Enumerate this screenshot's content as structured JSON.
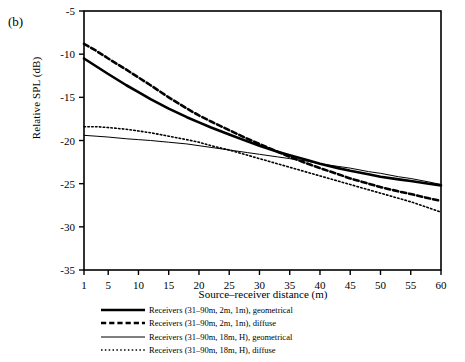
{
  "panel": {
    "label": "(b)"
  },
  "chart_data": {
    "type": "line",
    "title": "",
    "xlabel": "Source–receiver distance (m)",
    "ylabel": "Relative SPL (dB)",
    "xlim": [
      1,
      60
    ],
    "ylim": [
      -35,
      -5
    ],
    "grid": false,
    "legend_position": "below",
    "xticks": [
      1,
      5,
      10,
      15,
      20,
      25,
      30,
      35,
      40,
      45,
      50,
      55,
      60
    ],
    "yticks": [
      -5,
      -10,
      -15,
      -20,
      -25,
      -30,
      -35
    ],
    "x": [
      1,
      3,
      5,
      8,
      10,
      12,
      15,
      18,
      20,
      22,
      25,
      28,
      30,
      33,
      35,
      38,
      40,
      43,
      45,
      48,
      50,
      53,
      55,
      58,
      60
    ],
    "series": [
      {
        "name": "Receivers (31–90m, 2m, 1m), geometrical",
        "style": "solid",
        "width": 2.6,
        "color": "#000000",
        "values": [
          -10.5,
          -11.4,
          -12.3,
          -13.6,
          -14.4,
          -15.2,
          -16.3,
          -17.3,
          -17.9,
          -18.5,
          -19.3,
          -20.1,
          -20.6,
          -21.3,
          -21.7,
          -22.3,
          -22.7,
          -23.2,
          -23.5,
          -23.9,
          -24.2,
          -24.5,
          -24.7,
          -25.0,
          -25.2
        ]
      },
      {
        "name": "Receivers (31–90m, 2m, 1m), diffuse",
        "style": "dashed",
        "width": 2.6,
        "color": "#000000",
        "values": [
          -8.8,
          -9.6,
          -10.5,
          -11.8,
          -12.7,
          -13.6,
          -15.0,
          -16.3,
          -17.1,
          -17.8,
          -18.8,
          -19.8,
          -20.4,
          -21.3,
          -21.9,
          -22.7,
          -23.2,
          -23.9,
          -24.4,
          -25.0,
          -25.4,
          -25.9,
          -26.2,
          -26.7,
          -27.0
        ]
      },
      {
        "name": "Receivers (31–90m, 18m, H), geometrical",
        "style": "solid",
        "width": 1.0,
        "color": "#000000",
        "values": [
          -19.4,
          -19.5,
          -19.6,
          -19.8,
          -19.9,
          -20.0,
          -20.2,
          -20.4,
          -20.6,
          -20.8,
          -21.1,
          -21.4,
          -21.6,
          -21.9,
          -22.1,
          -22.4,
          -22.7,
          -23.0,
          -23.2,
          -23.6,
          -23.8,
          -24.2,
          -24.4,
          -24.8,
          -25.1
        ]
      },
      {
        "name": "Receivers (31–90m, 18m, H), diffuse",
        "style": "dotted",
        "width": 1.6,
        "color": "#000000",
        "values": [
          -18.4,
          -18.4,
          -18.5,
          -18.7,
          -18.9,
          -19.1,
          -19.5,
          -19.9,
          -20.2,
          -20.6,
          -21.1,
          -21.7,
          -22.1,
          -22.7,
          -23.1,
          -23.7,
          -24.1,
          -24.7,
          -25.1,
          -25.7,
          -26.1,
          -26.7,
          -27.1,
          -27.8,
          -28.3
        ]
      }
    ]
  }
}
